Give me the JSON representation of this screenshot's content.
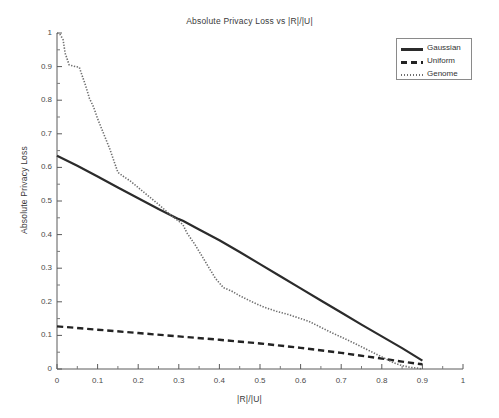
{
  "chart_data": {
    "type": "line",
    "title": "Absolute Privacy Loss vs |R|/|U|",
    "xlabel": "|R|/|U|",
    "ylabel": "Absolute Privacy Loss",
    "xlim": [
      0,
      1
    ],
    "ylim": [
      0,
      1
    ],
    "grid": false,
    "legend_position": "top-right",
    "xticks": [
      "0",
      "0.1",
      "0.2",
      "0.3",
      "0.4",
      "0.5",
      "0.6",
      "0.7",
      "0.8",
      "0.9",
      "1"
    ],
    "xtick_values": [
      0,
      0.1,
      0.2,
      0.3,
      0.4,
      0.5,
      0.6,
      0.7,
      0.8,
      0.9,
      1
    ],
    "yticks": [
      "0",
      "0.1",
      "0.2",
      "0.3",
      "0.4",
      "0.5",
      "0.6",
      "0.7",
      "0.8",
      "0.9",
      "1"
    ],
    "ytick_values": [
      0,
      0.1,
      0.2,
      0.3,
      0.4,
      0.5,
      0.6,
      0.7,
      0.8,
      0.9,
      1
    ],
    "series": [
      {
        "name": "Gaussian",
        "style": "solid",
        "color": "#2b2b2b",
        "width": 2.2,
        "x": [
          0.0,
          0.05,
          0.1,
          0.15,
          0.2,
          0.25,
          0.3,
          0.31,
          0.35,
          0.4,
          0.45,
          0.5,
          0.55,
          0.6,
          0.65,
          0.7,
          0.75,
          0.8,
          0.85,
          0.9
        ],
        "y": [
          0.635,
          0.605,
          0.573,
          0.54,
          0.508,
          0.476,
          0.446,
          0.441,
          0.415,
          0.383,
          0.348,
          0.312,
          0.276,
          0.24,
          0.204,
          0.168,
          0.132,
          0.097,
          0.062,
          0.025
        ]
      },
      {
        "name": "Uniform",
        "style": "dashed",
        "color": "#232323",
        "width": 2.4,
        "x": [
          0.0,
          0.1,
          0.2,
          0.3,
          0.4,
          0.5,
          0.6,
          0.7,
          0.8,
          0.85,
          0.9
        ],
        "y": [
          0.127,
          0.117,
          0.107,
          0.097,
          0.087,
          0.076,
          0.063,
          0.048,
          0.031,
          0.022,
          0.014
        ]
      },
      {
        "name": "Genome",
        "style": "dotted",
        "color": "#6e6e6e",
        "width": 1.6,
        "x": [
          0.0,
          0.008,
          0.015,
          0.02,
          0.03,
          0.045,
          0.055,
          0.06,
          0.07,
          0.08,
          0.09,
          0.1,
          0.11,
          0.12,
          0.13,
          0.14,
          0.15,
          0.165,
          0.18,
          0.2,
          0.22,
          0.25,
          0.28,
          0.3,
          0.31,
          0.32,
          0.34,
          0.36,
          0.375,
          0.39,
          0.41,
          0.43,
          0.45,
          0.48,
          0.51,
          0.54,
          0.57,
          0.6,
          0.62,
          0.64,
          0.67,
          0.7,
          0.73,
          0.76,
          0.79,
          0.81,
          0.83,
          0.85,
          0.87,
          0.89,
          0.9
        ],
        "y": [
          1.0,
          0.995,
          0.98,
          0.94,
          0.905,
          0.9,
          0.898,
          0.88,
          0.845,
          0.805,
          0.78,
          0.745,
          0.715,
          0.685,
          0.655,
          0.62,
          0.585,
          0.572,
          0.56,
          0.54,
          0.52,
          0.49,
          0.458,
          0.44,
          0.43,
          0.405,
          0.37,
          0.33,
          0.3,
          0.27,
          0.242,
          0.232,
          0.218,
          0.2,
          0.184,
          0.172,
          0.162,
          0.15,
          0.142,
          0.13,
          0.112,
          0.095,
          0.078,
          0.06,
          0.042,
          0.03,
          0.018,
          0.01,
          0.005,
          0.002,
          0.0
        ]
      }
    ]
  },
  "legend": {
    "items": [
      {
        "label": "Gaussian"
      },
      {
        "label": "Uniform"
      },
      {
        "label": "Genome"
      }
    ]
  },
  "axes": {
    "origin_px": {
      "x": 57,
      "y": 369
    },
    "right_px": 463,
    "top_px": 33
  }
}
